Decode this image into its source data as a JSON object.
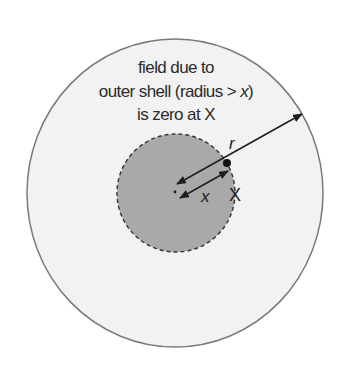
{
  "diagram": {
    "caption": {
      "line1": "field due to",
      "line2_prefix": "outer shell (radius > ",
      "line2_var": "x",
      "line2_suffix": ")",
      "line3": "is zero at X"
    },
    "labels": {
      "outer_radius": "r",
      "inner_radius": "x",
      "point": "X"
    },
    "colors": {
      "background": "#ffffff",
      "outer_fill": "#f2f2f2",
      "outer_stroke": "#7a7a7a",
      "inner_fill": "#a9a9a9",
      "inner_stroke": "#333333",
      "arrow": "#1e1e1e",
      "text": "#2b2b2b"
    }
  }
}
